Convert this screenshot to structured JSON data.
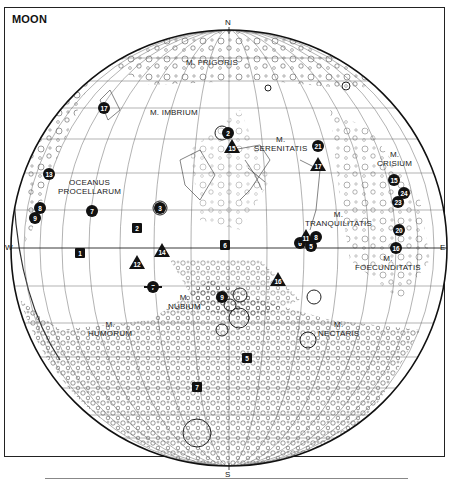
{
  "map": {
    "title": "MOON",
    "cardinals": {
      "north": "N",
      "south": "S",
      "west": "W",
      "east": "E"
    },
    "maria": [
      {
        "id": "frigoris",
        "lines": [
          "M. FRIGORIS"
        ]
      },
      {
        "id": "imbrium",
        "lines": [
          "M. IMBRIUM"
        ]
      },
      {
        "id": "serenitatis",
        "lines": [
          "M.",
          "SERENITATIS"
        ]
      },
      {
        "id": "crisium",
        "lines": [
          "M.",
          "CRISIUM"
        ]
      },
      {
        "id": "procellarum",
        "lines": [
          "OCEANUS",
          "PROCELLARUM"
        ]
      },
      {
        "id": "tranquilitatis",
        "lines": [
          "M.",
          "TRANQUILITATIS"
        ]
      },
      {
        "id": "foecunditatis",
        "lines": [
          "M.",
          "FOECUNDITATIS"
        ]
      },
      {
        "id": "nubium",
        "lines": [
          "M.",
          "NUBIUM"
        ]
      },
      {
        "id": "humorum",
        "lines": [
          "M.",
          "HUMORUM"
        ]
      },
      {
        "id": "nectaris",
        "lines": [
          "M.",
          "NECTARIS"
        ]
      }
    ],
    "markers": [
      {
        "label": "17",
        "shape": "circle",
        "x": 104,
        "y": 108
      },
      {
        "label": "2",
        "shape": "circle",
        "x": 228,
        "y": 133
      },
      {
        "label": "15",
        "shape": "triangle",
        "x": 232,
        "y": 146
      },
      {
        "label": "21",
        "shape": "circle",
        "x": 318,
        "y": 146
      },
      {
        "label": "17",
        "shape": "triangle",
        "x": 318,
        "y": 164
      },
      {
        "label": "15",
        "shape": "circle",
        "x": 394,
        "y": 180
      },
      {
        "label": "24",
        "shape": "circle",
        "x": 404,
        "y": 193
      },
      {
        "label": "23",
        "shape": "circle",
        "x": 398,
        "y": 202
      },
      {
        "label": "20",
        "shape": "circle",
        "x": 399,
        "y": 230
      },
      {
        "label": "16",
        "shape": "circle",
        "x": 396,
        "y": 248
      },
      {
        "label": "13",
        "shape": "circle",
        "x": 49,
        "y": 174
      },
      {
        "label": "8",
        "shape": "circle",
        "x": 40,
        "y": 208
      },
      {
        "label": "9",
        "shape": "circle",
        "x": 35,
        "y": 218
      },
      {
        "label": "7",
        "shape": "circle",
        "x": 92,
        "y": 211
      },
      {
        "label": "3",
        "shape": "circle",
        "x": 160,
        "y": 208
      },
      {
        "label": "2",
        "shape": "square",
        "x": 137,
        "y": 228
      },
      {
        "label": "1",
        "shape": "square",
        "x": 80,
        "y": 253
      },
      {
        "label": "12",
        "shape": "triangle",
        "x": 137,
        "y": 262
      },
      {
        "label": "14",
        "shape": "triangle",
        "x": 162,
        "y": 250
      },
      {
        "label": "7",
        "shape": "star",
        "x": 153,
        "y": 287
      },
      {
        "label": "6",
        "shape": "square",
        "x": 225,
        "y": 245
      },
      {
        "label": "6",
        "shape": "circle",
        "x": 300,
        "y": 243
      },
      {
        "label": "11",
        "shape": "triangle",
        "x": 306,
        "y": 236
      },
      {
        "label": "8",
        "shape": "circle",
        "x": 316,
        "y": 237
      },
      {
        "label": "5",
        "shape": "circle",
        "x": 311,
        "y": 246
      },
      {
        "label": "16",
        "shape": "triangle",
        "x": 278,
        "y": 279
      },
      {
        "label": "9",
        "shape": "circle",
        "x": 222,
        "y": 297
      },
      {
        "label": "5",
        "shape": "square",
        "x": 247,
        "y": 358
      },
      {
        "label": "7",
        "shape": "square",
        "x": 197,
        "y": 387
      }
    ]
  }
}
